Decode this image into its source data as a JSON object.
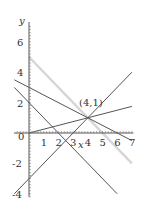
{
  "chart_data": {
    "type": "line",
    "title": "",
    "xlabel": "x",
    "ylabel": "y",
    "xlim": [
      -1,
      7
    ],
    "ylim": [
      -4,
      7
    ],
    "grid": false,
    "x_ticks": [
      "1",
      "2",
      "3",
      "4",
      "5",
      "6",
      "7"
    ],
    "y_ticks": [
      "-4",
      "-2",
      "0",
      "2",
      "4",
      "6"
    ],
    "origin_label": "0",
    "annotation": {
      "text": "(4,1)",
      "x": 4,
      "y": 1
    },
    "series": [
      {
        "name": "y = 5 - x",
        "x": [
          0,
          7
        ],
        "y": [
          5,
          -2
        ],
        "color": "#d6d6d6",
        "width": 2.5
      },
      {
        "name": "y = 3 - x/2",
        "x": [
          -1,
          7
        ],
        "y": [
          3.5,
          -0.5
        ],
        "color": "#555555",
        "width": 1
      },
      {
        "name": "y = x/4",
        "x": [
          0,
          7
        ],
        "y": [
          0,
          1.75
        ],
        "color": "#555555",
        "width": 1
      },
      {
        "name": "y = x - 3",
        "x": [
          -1,
          7
        ],
        "y": [
          -4,
          4
        ],
        "color": "#555555",
        "width": 1
      },
      {
        "name": "y = 2 - x",
        "x": [
          -1,
          6
        ],
        "y": [
          3,
          -4
        ],
        "color": "#555555",
        "width": 1
      }
    ]
  }
}
